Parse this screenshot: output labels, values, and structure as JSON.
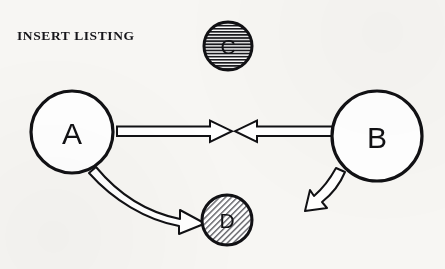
{
  "canvas": {
    "width": 445,
    "height": 269,
    "background_color": "#f7f6f3",
    "ink_color": "#111114"
  },
  "caption": {
    "text": "INSERT LISTING"
  },
  "nodes": [
    {
      "id": "A",
      "label": "A",
      "cx": 72,
      "cy": 132,
      "r": 41,
      "fill_style": "white",
      "fill_color": "#ffffff",
      "stroke_color": "#111114",
      "stroke_width": 3.2,
      "size": "large"
    },
    {
      "id": "B",
      "label": "B",
      "cx": 377,
      "cy": 136,
      "r": 45,
      "fill_style": "white",
      "fill_color": "#ffffff",
      "stroke_color": "#111114",
      "stroke_width": 3.2,
      "size": "large"
    },
    {
      "id": "C",
      "label": "C",
      "cx": 228,
      "cy": 46,
      "r": 24,
      "fill_style": "horizontal-hatch",
      "fill_color": "#c9c9c9",
      "stroke_color": "#111114",
      "stroke_width": 3.0,
      "size": "small"
    },
    {
      "id": "D",
      "label": "D",
      "cx": 227,
      "cy": 220,
      "r": 25,
      "fill_style": "diagonal-hatch",
      "fill_color": "#c9c9c9",
      "stroke_color": "#111114",
      "stroke_width": 3.0,
      "size": "small"
    }
  ],
  "edges": [
    {
      "id": "a-to-mid",
      "from": "A",
      "to": "midpoint",
      "shape": "straight",
      "style": "hollow-block-arrow",
      "direction": "right",
      "x_start": 117,
      "x_end": 232,
      "y_center": 131
    },
    {
      "id": "b-to-mid",
      "from": "B",
      "to": "midpoint",
      "shape": "straight",
      "style": "hollow-block-arrow",
      "direction": "left",
      "x_start": 334,
      "x_end": 235,
      "y_center": 131
    },
    {
      "id": "a-to-d",
      "from": "A",
      "to": "D",
      "shape": "curved",
      "style": "hollow-curved-arrow",
      "direction": "down-right"
    },
    {
      "id": "b-outward",
      "from": "B",
      "to": "",
      "shape": "curved",
      "style": "hollow-curved-arrow",
      "direction": "down-left"
    }
  ]
}
